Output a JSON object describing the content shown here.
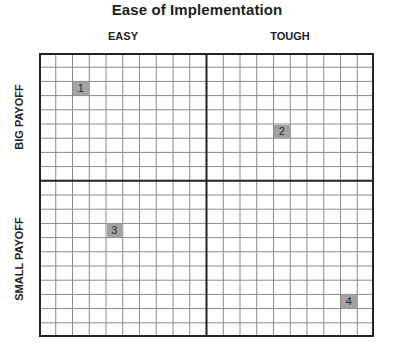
{
  "chart_data": {
    "type": "table",
    "title": "Ease of Implementation",
    "x_axis": {
      "label": "Ease of Implementation",
      "categories": [
        "EASY",
        "TOUGH"
      ]
    },
    "y_axis": {
      "categories": [
        "BIG PAYOFF",
        "SMALL PAYOFF"
      ]
    },
    "grid": {
      "columns_per_quadrant": 10,
      "rows_top_quadrant": 9,
      "rows_bottom_quadrant": 11
    },
    "items": [
      {
        "label": "1",
        "quadrant": "EASY / BIG PAYOFF",
        "col": 2,
        "row": 2
      },
      {
        "label": "2",
        "quadrant": "TOUGH / BIG PAYOFF",
        "col": 14,
        "row": 5
      },
      {
        "label": "3",
        "quadrant": "EASY / SMALL PAYOFF",
        "col": 4,
        "row": 12
      },
      {
        "label": "4",
        "quadrant": "TOUGH / SMALL PAYOFF",
        "col": 18,
        "row": 17
      }
    ]
  },
  "title": "Ease of Implementation",
  "columns": {
    "left": "EASY",
    "right": "TOUGH"
  },
  "rows": {
    "top": "BIG PAYOFF",
    "bottom": "SMALL PAYOFF"
  },
  "markers": [
    {
      "label": "1",
      "col": 2,
      "row": 2
    },
    {
      "label": "2",
      "col": 14,
      "row": 5
    },
    {
      "label": "3",
      "col": 4,
      "row": 12
    },
    {
      "label": "4",
      "col": 18,
      "row": 17
    }
  ],
  "colors": {
    "marker_fill": "#a3a3a3",
    "grid_line": "#8a8a8a",
    "axis_line": "#222222"
  }
}
